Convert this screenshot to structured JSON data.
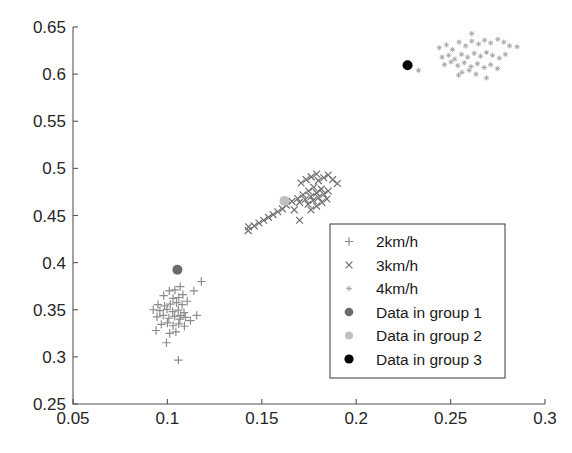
{
  "figure": {
    "title": "",
    "background": "#ffffff",
    "axis_color": "#555555"
  },
  "axes": {
    "x": {
      "label": "",
      "min": 0.05,
      "max": 0.3,
      "ticks": [
        0.05,
        0.1,
        0.15,
        0.2,
        0.25,
        0.3
      ],
      "tick_labels": [
        "0.05",
        "0.1",
        "0.15",
        "0.2",
        "0.25",
        "0.3"
      ]
    },
    "y": {
      "label": "",
      "min": 0.25,
      "max": 0.65,
      "ticks": [
        0.25,
        0.3,
        0.35,
        0.4,
        0.45,
        0.5,
        0.55,
        0.6,
        0.65
      ],
      "tick_labels": [
        "0.25",
        "0.3",
        "0.35",
        "0.4",
        "0.45",
        "0.5",
        "0.55",
        "0.6",
        "0.65"
      ]
    }
  },
  "legend": {
    "position": "center-right",
    "border_color": "#4a4a4a",
    "entries": [
      {
        "label": "2km/h",
        "marker": "plus",
        "color": "#8c8c8c"
      },
      {
        "label": "3km/h",
        "marker": "cross",
        "color": "#6e6e6e"
      },
      {
        "label": "4km/h",
        "marker": "star",
        "color": "#a6a6a6"
      },
      {
        "label": "Data in group 1",
        "marker": "dot",
        "color": "#6b6b6b"
      },
      {
        "label": "Data in group 2",
        "marker": "dot",
        "color": "#c0c0c0"
      },
      {
        "label": "Data in group 3",
        "marker": "dot",
        "color": "#000000"
      }
    ]
  },
  "chart_data": {
    "type": "scatter",
    "title": "",
    "xlabel": "",
    "ylabel": "",
    "xlim": [
      0.05,
      0.3
    ],
    "ylim": [
      0.25,
      0.65
    ],
    "grid": false,
    "legend_position": "center-right",
    "series": [
      {
        "name": "2km/h",
        "marker": "plus",
        "color": "#8c8c8c",
        "points": [
          [
            0.098,
            0.365
          ],
          [
            0.101,
            0.37
          ],
          [
            0.104,
            0.371
          ],
          [
            0.1068,
            0.3745
          ],
          [
            0.103,
            0.362
          ],
          [
            0.106,
            0.363
          ],
          [
            0.095,
            0.3555
          ],
          [
            0.0985,
            0.354
          ],
          [
            0.1015,
            0.356
          ],
          [
            0.1048,
            0.3575
          ],
          [
            0.1078,
            0.3555
          ],
          [
            0.1105,
            0.359
          ],
          [
            0.0925,
            0.35
          ],
          [
            0.096,
            0.349
          ],
          [
            0.0998,
            0.3505
          ],
          [
            0.1028,
            0.348
          ],
          [
            0.1058,
            0.3495
          ],
          [
            0.1088,
            0.347
          ],
          [
            0.0945,
            0.3425
          ],
          [
            0.0978,
            0.344
          ],
          [
            0.1008,
            0.341
          ],
          [
            0.1038,
            0.343
          ],
          [
            0.1066,
            0.34
          ],
          [
            0.1095,
            0.342
          ],
          [
            0.0968,
            0.3345
          ],
          [
            0.1,
            0.336
          ],
          [
            0.103,
            0.333
          ],
          [
            0.106,
            0.335
          ],
          [
            0.109,
            0.3325
          ],
          [
            0.1122,
            0.3385
          ],
          [
            0.094,
            0.328
          ],
          [
            0.1012,
            0.325
          ],
          [
            0.1045,
            0.3265
          ],
          [
            0.1155,
            0.344
          ],
          [
            0.118,
            0.38
          ],
          [
            0.114,
            0.37
          ],
          [
            0.0995,
            0.315
          ],
          [
            0.1058,
            0.2965
          ],
          [
            0.107,
            0.344
          ],
          [
            0.1082,
            0.366
          ]
        ]
      },
      {
        "name": "3km/h",
        "marker": "cross",
        "color": "#6e6e6e",
        "points": [
          [
            0.163,
            0.461
          ],
          [
            0.166,
            0.465
          ],
          [
            0.169,
            0.468
          ],
          [
            0.1718,
            0.472
          ],
          [
            0.1748,
            0.476
          ],
          [
            0.1775,
            0.48
          ],
          [
            0.17,
            0.464
          ],
          [
            0.173,
            0.467
          ],
          [
            0.176,
            0.47
          ],
          [
            0.179,
            0.474
          ],
          [
            0.1815,
            0.478
          ],
          [
            0.1745,
            0.462
          ],
          [
            0.1772,
            0.466
          ],
          [
            0.18,
            0.469
          ],
          [
            0.1828,
            0.4725
          ],
          [
            0.1852,
            0.476
          ],
          [
            0.176,
            0.456
          ],
          [
            0.179,
            0.46
          ],
          [
            0.1818,
            0.464
          ],
          [
            0.1845,
            0.4675
          ],
          [
            0.18,
            0.487
          ],
          [
            0.1828,
            0.49
          ],
          [
            0.1852,
            0.493
          ],
          [
            0.179,
            0.494
          ],
          [
            0.1762,
            0.491
          ],
          [
            0.1735,
            0.488
          ],
          [
            0.1708,
            0.4845
          ],
          [
            0.1875,
            0.488
          ],
          [
            0.19,
            0.484
          ],
          [
            0.156,
            0.451
          ],
          [
            0.1585,
            0.454
          ],
          [
            0.161,
            0.457
          ],
          [
            0.1535,
            0.448
          ],
          [
            0.151,
            0.445
          ],
          [
            0.1485,
            0.442
          ],
          [
            0.146,
            0.439
          ],
          [
            0.143,
            0.438
          ],
          [
            0.1428,
            0.434
          ],
          [
            0.1672,
            0.456
          ],
          [
            0.17,
            0.445
          ]
        ]
      },
      {
        "name": "4km/h",
        "marker": "star",
        "color": "#a6a6a6",
        "points": [
          [
            0.244,
            0.628
          ],
          [
            0.2478,
            0.631
          ],
          [
            0.251,
            0.626
          ],
          [
            0.2545,
            0.634
          ],
          [
            0.258,
            0.63
          ],
          [
            0.2612,
            0.635
          ],
          [
            0.2648,
            0.632
          ],
          [
            0.268,
            0.636
          ],
          [
            0.2712,
            0.633
          ],
          [
            0.275,
            0.637
          ],
          [
            0.2782,
            0.634
          ],
          [
            0.2812,
            0.63
          ],
          [
            0.2455,
            0.618
          ],
          [
            0.249,
            0.62
          ],
          [
            0.2522,
            0.616
          ],
          [
            0.2558,
            0.621
          ],
          [
            0.259,
            0.618
          ],
          [
            0.2625,
            0.622
          ],
          [
            0.2658,
            0.619
          ],
          [
            0.269,
            0.623
          ],
          [
            0.2722,
            0.62
          ],
          [
            0.2758,
            0.617
          ],
          [
            0.279,
            0.621
          ],
          [
            0.2468,
            0.61
          ],
          [
            0.2502,
            0.613
          ],
          [
            0.2538,
            0.609
          ],
          [
            0.2572,
            0.612
          ],
          [
            0.2608,
            0.608
          ],
          [
            0.2642,
            0.611
          ],
          [
            0.2678,
            0.607
          ],
          [
            0.2712,
            0.61
          ],
          [
            0.2748,
            0.606
          ],
          [
            0.256,
            0.602
          ],
          [
            0.2598,
            0.604
          ],
          [
            0.2635,
            0.6
          ],
          [
            0.233,
            0.604
          ],
          [
            0.2852,
            0.629
          ],
          [
            0.2612,
            0.643
          ],
          [
            0.2542,
            0.599
          ],
          [
            0.269,
            0.596
          ]
        ]
      }
    ],
    "centroids": [
      {
        "name": "Data in group 1",
        "x": 0.1053,
        "y": 0.3925,
        "color": "#6b6b6b"
      },
      {
        "name": "Data in group 2",
        "x": 0.162,
        "y": 0.4655,
        "color": "#c0c0c0"
      },
      {
        "name": "Data in group 3",
        "x": 0.2272,
        "y": 0.6095,
        "color": "#000000"
      }
    ]
  }
}
